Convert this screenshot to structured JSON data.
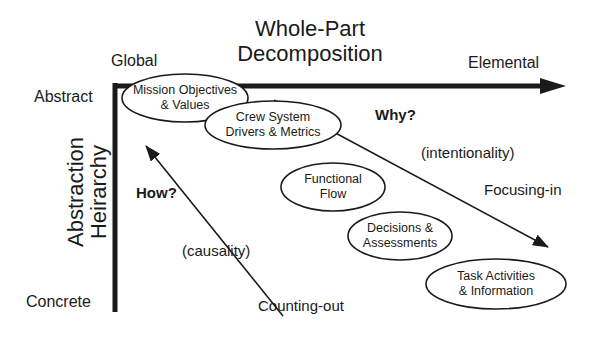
{
  "title": {
    "line1": "Whole-Part",
    "line2": "Decomposition"
  },
  "horizontal_axis": {
    "left_label": "Global",
    "right_label": "Elemental"
  },
  "vertical_axis": {
    "title_line1": "Abstraction",
    "title_line2": "Heirarchy",
    "top_label": "Abstract",
    "bottom_label": "Concrete"
  },
  "levels": [
    {
      "line1": "Mission Objectives",
      "line2": "& Values"
    },
    {
      "line1": "Crew System",
      "line2": "Drivers & Metrics"
    },
    {
      "line1": "Functional",
      "line2": "Flow"
    },
    {
      "line1": "Decisions &",
      "line2": "Assessments"
    },
    {
      "line1": "Task Activities",
      "line2": "& Information"
    }
  ],
  "upper_region": {
    "question": "Why?",
    "concept": "(intentionality)",
    "direction": "Focusing-in"
  },
  "lower_region": {
    "question": "How?",
    "concept": "(causality)",
    "direction": "Counting-out"
  },
  "colors": {
    "ink": "#1a1a1a",
    "background": "#ffffff"
  }
}
